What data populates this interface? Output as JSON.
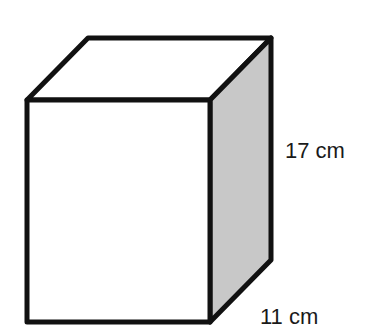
{
  "diagram": {
    "type": "rectangular-prism",
    "colors": {
      "stroke": "#111111",
      "front_face": "#ffffff",
      "top_face": "#ffffff",
      "side_face": "#c8c8c8"
    },
    "labels": {
      "height": "17 cm",
      "depth": "11 cm"
    }
  }
}
